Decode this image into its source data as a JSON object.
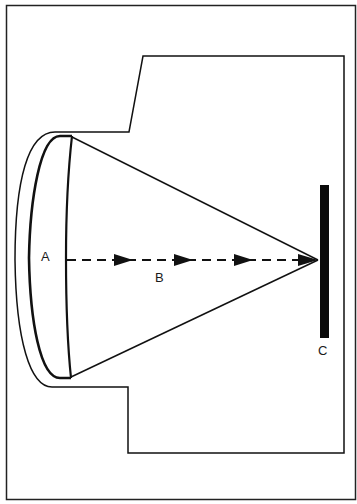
{
  "diagram": {
    "labels": {
      "A": "A",
      "B": "B",
      "C": "C"
    },
    "colors": {
      "stroke": "#111111",
      "background": "#ffffff"
    },
    "arrow_count": 4
  }
}
